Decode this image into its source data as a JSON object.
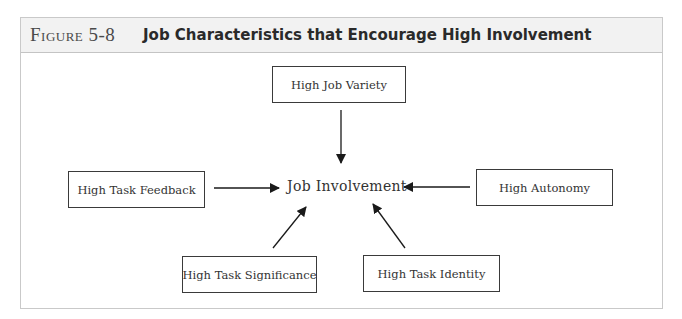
{
  "figure": {
    "label": "Figure 5-8",
    "title": "Job Characteristics that Encourage High Involvement"
  },
  "diagram": {
    "center": "Job Involvement",
    "nodes": [
      {
        "id": "variety",
        "label": "High Job Variety",
        "position": "top"
      },
      {
        "id": "feedback",
        "label": "High Task Feedback",
        "position": "left"
      },
      {
        "id": "autonomy",
        "label": "High Autonomy",
        "position": "right"
      },
      {
        "id": "significance",
        "label": "High Task Significance",
        "position": "bottom-left"
      },
      {
        "id": "identity",
        "label": "High Task Identity",
        "position": "bottom-right"
      }
    ],
    "edges": [
      {
        "from": "variety",
        "to": "center"
      },
      {
        "from": "feedback",
        "to": "center"
      },
      {
        "from": "autonomy",
        "to": "center"
      },
      {
        "from": "significance",
        "to": "center"
      },
      {
        "from": "identity",
        "to": "center"
      }
    ]
  },
  "colors": {
    "header_bg": "#f2f2f2",
    "frame_border": "#c9c9c9",
    "box_border": "#3a3a3a",
    "arrow": "#1a1a1a"
  }
}
